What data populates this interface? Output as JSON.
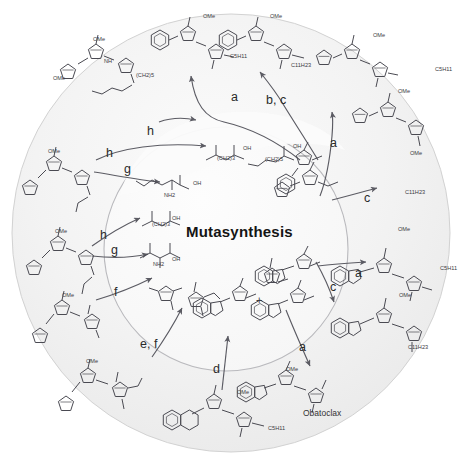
{
  "figure": {
    "title": "Mutasynthesis",
    "center_label": "Mutasynthesis",
    "background_color": "#ffffff",
    "outer_circle_fill": "#f2f2f2",
    "inner_circle_fill": "#fafafa",
    "structure_stroke": "#4a4a52",
    "arrow_color": "#5b5b63",
    "label_color": "#2a2a2a"
  },
  "step_labels": [
    {
      "id": "a-top",
      "text": "a",
      "x": 231,
      "y": 98
    },
    {
      "id": "bc-top",
      "text": "b, c",
      "x": 268,
      "y": 101
    },
    {
      "id": "a-topright",
      "text": "a",
      "x": 330,
      "y": 144
    },
    {
      "id": "c-right",
      "text": "c",
      "x": 364,
      "y": 198
    },
    {
      "id": "h-topleft",
      "text": "h",
      "x": 147,
      "y": 131
    },
    {
      "id": "h-upperleft",
      "text": "h",
      "x": 106,
      "y": 154
    },
    {
      "id": "g-upperleft",
      "text": "g",
      "x": 124,
      "y": 170
    },
    {
      "id": "h-midleft",
      "text": "h",
      "x": 100,
      "y": 236
    },
    {
      "id": "g-midleft",
      "text": "g",
      "x": 111,
      "y": 251
    },
    {
      "id": "f-left",
      "text": "f",
      "x": 114,
      "y": 293
    },
    {
      "id": "ef-lowleft",
      "text": "e, f",
      "x": 143,
      "y": 345
    },
    {
      "id": "d-bottom",
      "text": "d",
      "x": 213,
      "y": 370
    },
    {
      "id": "a-right",
      "text": "a",
      "x": 355,
      "y": 274
    },
    {
      "id": "c-right2",
      "text": "c",
      "x": 330,
      "y": 288
    },
    {
      "id": "a-bottomright",
      "text": "a",
      "x": 299,
      "y": 348
    }
  ],
  "compound_labels": [
    {
      "id": "obatoclax",
      "text": "Obatoclax",
      "x": 303,
      "y": 413
    }
  ],
  "structure_annotations": [
    {
      "id": "ome-1",
      "text": "OMe",
      "x": 203,
      "y": 13
    },
    {
      "id": "ome-2",
      "text": "OMe",
      "x": 270,
      "y": 13
    },
    {
      "id": "ome-3",
      "text": "OMe",
      "x": 373,
      "y": 32
    },
    {
      "id": "ome-4",
      "text": "OMe",
      "x": 398,
      "y": 88
    },
    {
      "id": "ome-5",
      "text": "OMe",
      "x": 93,
      "y": 36
    },
    {
      "id": "ome-6",
      "text": "OMe",
      "x": 53,
      "y": 75
    },
    {
      "id": "ome-7",
      "text": "OMe",
      "x": 48,
      "y": 148
    },
    {
      "id": "ome-8",
      "text": "OMe",
      "x": 410,
      "y": 150
    },
    {
      "id": "ome-9",
      "text": "OMe",
      "x": 55,
      "y": 228
    },
    {
      "id": "ome-10",
      "text": "OMe",
      "x": 398,
      "y": 226
    },
    {
      "id": "ome-11",
      "text": "OMe",
      "x": 62,
      "y": 292
    },
    {
      "id": "ome-12",
      "text": "OMe",
      "x": 399,
      "y": 292
    },
    {
      "id": "ome-13",
      "text": "OMe",
      "x": 86,
      "y": 358
    },
    {
      "id": "ome-14",
      "text": "OMe",
      "x": 237,
      "y": 389
    },
    {
      "id": "ome-15",
      "text": "OMe",
      "x": 286,
      "y": 366
    },
    {
      "id": "c5h11",
      "text": "C5H11",
      "x": 230,
      "y": 53
    },
    {
      "id": "c11h23a",
      "text": "C11H23",
      "x": 291,
      "y": 62
    },
    {
      "id": "c5h11b",
      "text": "C5H11",
      "x": 435,
      "y": 66
    },
    {
      "id": "c11h23b",
      "text": "C11H23",
      "x": 405,
      "y": 189
    },
    {
      "id": "c5h11c",
      "text": "C5H11",
      "x": 440,
      "y": 265
    },
    {
      "id": "c11h23c",
      "text": "C11H23",
      "x": 408,
      "y": 344
    },
    {
      "id": "c5h11d",
      "text": "C5H11",
      "x": 268,
      "y": 425
    },
    {
      "id": "nh-1",
      "text": "NH",
      "x": 104,
      "y": 58
    },
    {
      "id": "ch25-1",
      "text": "(CH2)5",
      "x": 136,
      "y": 72
    },
    {
      "id": "oh-1",
      "text": "OH",
      "x": 243,
      "y": 145
    },
    {
      "id": "oh-2",
      "text": "OH",
      "x": 293,
      "y": 143
    },
    {
      "id": "ch23-1",
      "text": "(CH2)3",
      "x": 217,
      "y": 155
    },
    {
      "id": "ch23-2",
      "text": "(CH2)5",
      "x": 265,
      "y": 156
    },
    {
      "id": "oh-3",
      "text": "OH",
      "x": 193,
      "y": 180
    },
    {
      "id": "nh2-1",
      "text": "NH2",
      "x": 164,
      "y": 192
    },
    {
      "id": "oh-4",
      "text": "OH",
      "x": 172,
      "y": 215
    },
    {
      "id": "ch23-3",
      "text": "(CH2)3",
      "x": 152,
      "y": 221
    },
    {
      "id": "oh-5",
      "text": "OH",
      "x": 172,
      "y": 256
    },
    {
      "id": "nh2-2",
      "text": "NH2",
      "x": 153,
      "y": 261
    },
    {
      "id": "plus",
      "text": "+",
      "x": 256,
      "y": 294
    }
  ],
  "legend_steps": [
    "a",
    "b",
    "c",
    "d",
    "e",
    "f",
    "g",
    "h"
  ]
}
